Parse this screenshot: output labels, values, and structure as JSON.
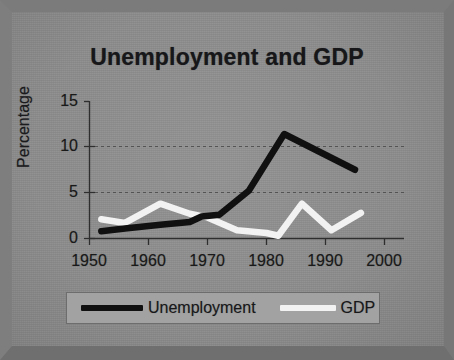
{
  "chart_data": {
    "type": "line",
    "title": "Unemployment and GDP",
    "xlabel": "",
    "ylabel": "Percentage",
    "xlim": [
      1950,
      2000
    ],
    "ylim": [
      0,
      15
    ],
    "xticks": [
      "1950",
      "1960",
      "1970",
      "1980",
      "1990",
      "2000"
    ],
    "yticks": [
      "0",
      "5",
      "10",
      "15"
    ],
    "grid": "horizontal-dashed",
    "legend_position": "bottom",
    "series": [
      {
        "name": "Unemployment",
        "color": "#101010",
        "points": [
          {
            "x": 1952,
            "y": 0.8
          },
          {
            "x": 1956,
            "y": 1.1
          },
          {
            "x": 1962,
            "y": 1.5
          },
          {
            "x": 1967,
            "y": 1.8
          },
          {
            "x": 1969,
            "y": 2.4
          },
          {
            "x": 1972,
            "y": 2.6
          },
          {
            "x": 1977,
            "y": 5.2
          },
          {
            "x": 1983,
            "y": 11.4
          },
          {
            "x": 1995,
            "y": 7.5
          }
        ]
      },
      {
        "name": "GDP",
        "color": "#f2f2f2",
        "points": [
          {
            "x": 1952,
            "y": 2.1
          },
          {
            "x": 1956,
            "y": 1.7
          },
          {
            "x": 1962,
            "y": 3.8
          },
          {
            "x": 1967,
            "y": 2.7
          },
          {
            "x": 1970,
            "y": 2.3
          },
          {
            "x": 1975,
            "y": 0.9
          },
          {
            "x": 1980,
            "y": 0.6
          },
          {
            "x": 1982,
            "y": 0.3
          },
          {
            "x": 1986,
            "y": 3.8
          },
          {
            "x": 1991,
            "y": 0.9
          },
          {
            "x": 1996,
            "y": 2.8
          }
        ]
      }
    ]
  },
  "chart": {
    "title": "Unemployment and GDP",
    "y_axis_title": "Percentage",
    "y_ticks": [
      "15",
      "10",
      "5",
      "0"
    ],
    "x_ticks": [
      "1950",
      "1960",
      "1970",
      "1980",
      "1990",
      "2000"
    ]
  },
  "legend": {
    "items": [
      {
        "label": "Unemployment",
        "color": "#101010"
      },
      {
        "label": "GDP",
        "color": "#f2f2f2"
      }
    ]
  }
}
